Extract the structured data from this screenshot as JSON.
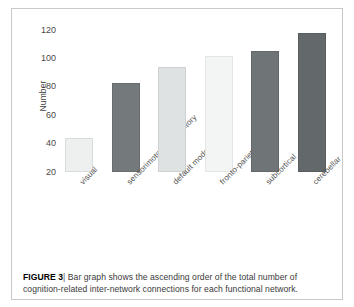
{
  "figure": {
    "caption_label": "FIGURE 3",
    "caption_separator": "|",
    "caption_text": "Bar graph shows the ascending order of the total number of cognition-related inter-network connections for each functional network."
  },
  "chart_data": {
    "type": "bar",
    "title": "",
    "xlabel": "",
    "ylabel": "Number",
    "categories": [
      "visual",
      "sensorimotor and auditory",
      "default mode",
      "fronto-parietal",
      "subcortical",
      "cerebellar"
    ],
    "values": [
      44,
      83,
      94,
      102,
      105,
      118
    ],
    "bar_colors": [
      "#eef0ef",
      "#74797b",
      "#dfe2e2",
      "#f3f5f5",
      "#6f7476",
      "#63686a"
    ],
    "bar_border_colors": [
      "#d8dbdb",
      "#676c6e",
      "#cfd2d2",
      "#e3e6e6",
      "#63686a",
      "#585d5f"
    ],
    "ylim": [
      20,
      126
    ],
    "yticks": [
      20,
      40,
      60,
      80,
      100,
      120
    ],
    "ytick_labels": [
      "20",
      "40",
      "60",
      "80",
      "100",
      "120"
    ],
    "grid": false,
    "legend": "none",
    "xtick_rotation": -45
  }
}
